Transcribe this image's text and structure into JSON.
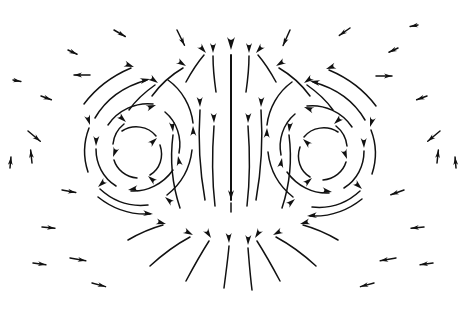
{
  "figure": {
    "caption": "",
    "background_color": "#ffffff",
    "width": 467,
    "height": 319
  },
  "chart_data": {
    "type": "scatter",
    "subtype": "vector-field-quiver",
    "subtitle": "",
    "xlabel": "",
    "ylabel": "",
    "xlim": [
      0,
      467
    ],
    "ylim": [
      0,
      319
    ],
    "grid": false,
    "legend": "none",
    "annotations": [],
    "tick_labels": {
      "x": [],
      "y": []
    },
    "style": {
      "arrow_color": "#111111",
      "cloud_fill": "#b9b9b9",
      "cloud_stipple": "#9a9a9a",
      "background": "#ffffff"
    },
    "features": {
      "cloud_boundary": {
        "description": "stippled gray kidney/mushroom shaped cloud outline band",
        "band_thickness_px": 13,
        "outer_path": "M 66,168 C 64,140 78,110 104,88 C 132,64 168,48 205,43 C 245,38 288,46 320,62 C 352,78 378,100 392,124 C 404,145 406,168 398,186 C 390,204 372,216 350,222 C 320,230 286,228 258,219 C 243,214 234,208 228,202 C 221,209 210,216 196,221 C 170,231 136,233 110,224 C 86,216 70,196 66,168 Z",
        "inner_path": "M 80,168 C 78,144 91,117 114,98 C 140,77 172,62 206,57 C 244,52 283,59 312,74 C 341,89 365,109 378,130 C 388,148 390,167 383,182 C 376,197 360,206 341,211 C 314,218 284,216 259,208 C 244,203 234,195 228,188 C 220,196 209,204 195,209 C 172,218 141,219 118,211 C 97,204 84,188 80,168 Z"
      },
      "vortex_cores": [
        {
          "name": "left-vortex",
          "center_x": 140,
          "center_y": 150,
          "rotation": "clockwise"
        },
        {
          "name": "right-vortex",
          "center_x": 320,
          "center_y": 152,
          "rotation": "counterclockwise"
        }
      ],
      "central_jet": {
        "name": "central-updraft",
        "x": 231,
        "from_y": 200,
        "to_y": 48,
        "direction": "up",
        "description": "strong vertical upward jet arrow through the middle"
      }
    },
    "streamlines": [
      {
        "id": "L-core-1",
        "path": "M 122,131 C 133,124 148,126 156,136",
        "head": [
          157,
          138,
          42
        ]
      },
      {
        "id": "L-core-2",
        "path": "M 160,145 C 164,157 160,169 150,175",
        "head": [
          148,
          176,
          140
        ]
      },
      {
        "id": "L-core-3",
        "path": "M 137,178 C 126,177 117,170 114,160",
        "head": [
          113,
          157,
          250
        ]
      },
      {
        "id": "L-core-4",
        "path": "M 113,144 C 114,134 119,128 124,124",
        "head": [
          126,
          122,
          318
        ]
      },
      {
        "id": "L-mid-1",
        "path": "M 108,125 C 118,110 136,102 153,104",
        "head": [
          156,
          105,
          20
        ]
      },
      {
        "id": "L-mid-2",
        "path": "M 165,112 C 177,122 182,138 179,153",
        "head": [
          178,
          156,
          100
        ]
      },
      {
        "id": "L-mid-3",
        "path": "M 173,170 C 163,184 147,192 131,191",
        "head": [
          128,
          190,
          190
        ]
      },
      {
        "id": "L-mid-4",
        "path": "M 116,186 C 103,178 96,164 96,149",
        "head": [
          96,
          146,
          268
        ]
      },
      {
        "id": "L-outer-1",
        "path": "M 95,118 C 106,99 125,86 147,80",
        "head": [
          150,
          79,
          12
        ]
      },
      {
        "id": "L-outer-2",
        "path": "M 168,80 C 182,90 191,106 193,123",
        "head": [
          193,
          126,
          92
        ]
      },
      {
        "id": "L-outer-3",
        "path": "M 192,150 C 190,168 181,184 167,195",
        "head": [
          165,
          197,
          140
        ]
      },
      {
        "id": "L-outer-4",
        "path": "M 148,205 C 130,207 113,201 100,189",
        "head": [
          98,
          187,
          222
        ]
      },
      {
        "id": "L-outer-5",
        "path": "M 88,172 C 83,157 84,141 89,128",
        "head": [
          90,
          125,
          287
        ]
      },
      {
        "id": "L-rim-1",
        "path": "M 98,197 C 113,209 131,215 150,214",
        "head": [
          153,
          214,
          355
        ]
      },
      {
        "id": "L-rim-2",
        "path": "M 84,104 C 96,88 112,76 131,68",
        "head": [
          134,
          67,
          340
        ]
      },
      {
        "id": "L-up-1",
        "path": "M 205,200 C 200,172 198,140 200,110",
        "head": [
          200,
          107,
          272
        ]
      },
      {
        "id": "L-up-2",
        "path": "M 180,208 C 172,184 170,158 173,135",
        "head": [
          173,
          132,
          276
        ]
      },
      {
        "id": "L-up-3",
        "path": "M 215,206 C 212,180 212,152 214,126",
        "head": [
          214,
          123,
          272
        ]
      },
      {
        "id": "C-jet",
        "path": "M 231,200 L 231,55",
        "head": [
          231,
          50,
          270
        ]
      },
      {
        "id": "C-left-up",
        "path": "M 216,92 C 214,78 213,66 213,56",
        "head": [
          213,
          53,
          270
        ]
      },
      {
        "id": "C-right-up",
        "path": "M 246,92 C 248,78 249,66 249,56",
        "head": [
          249,
          53,
          270
        ]
      },
      {
        "id": "R-up-1",
        "path": "M 256,200 C 261,172 263,140 261,110",
        "head": [
          261,
          107,
          268
        ]
      },
      {
        "id": "R-up-2",
        "path": "M 282,208 C 290,184 292,158 289,135",
        "head": [
          289,
          132,
          264
        ]
      },
      {
        "id": "R-up-3",
        "path": "M 247,206 C 250,180 250,152 248,126",
        "head": [
          248,
          123,
          268
        ]
      },
      {
        "id": "R-core-1",
        "path": "M 338,132 C 327,125 312,127 304,137",
        "head": [
          303,
          139,
          138
        ]
      },
      {
        "id": "R-core-2",
        "path": "M 300,147 C 296,159 300,171 310,177",
        "head": [
          312,
          178,
          40
        ]
      },
      {
        "id": "R-core-3",
        "path": "M 323,180 C 334,179 343,172 346,162",
        "head": [
          347,
          159,
          290
        ]
      },
      {
        "id": "R-core-4",
        "path": "M 347,146 C 346,136 341,130 336,126",
        "head": [
          334,
          124,
          222
        ]
      },
      {
        "id": "R-mid-1",
        "path": "M 352,127 C 342,112 324,104 307,106",
        "head": [
          304,
          107,
          160
        ]
      },
      {
        "id": "R-mid-2",
        "path": "M 295,114 C 283,124 278,140 281,155",
        "head": [
          282,
          158,
          80
        ]
      },
      {
        "id": "R-mid-3",
        "path": "M 287,172 C 297,186 313,194 329,193",
        "head": [
          332,
          192,
          350
        ]
      },
      {
        "id": "R-mid-4",
        "path": "M 344,188 C 357,180 364,166 364,151",
        "head": [
          364,
          148,
          272
        ]
      },
      {
        "id": "R-outer-1",
        "path": "M 365,120 C 354,101 335,88 313,82",
        "head": [
          310,
          81,
          168
        ]
      },
      {
        "id": "R-outer-2",
        "path": "M 292,82 C 278,92 269,108 267,125",
        "head": [
          267,
          128,
          88
        ]
      },
      {
        "id": "R-outer-3",
        "path": "M 268,152 C 270,170 279,186 293,197",
        "head": [
          295,
          199,
          40
        ]
      },
      {
        "id": "R-outer-4",
        "path": "M 312,207 C 330,209 347,203 360,191",
        "head": [
          362,
          189,
          318
        ]
      },
      {
        "id": "R-outer-5",
        "path": "M 372,174 C 377,159 376,143 371,130",
        "head": [
          370,
          127,
          253
        ]
      },
      {
        "id": "R-rim-1",
        "path": "M 362,199 C 347,211 329,217 310,216",
        "head": [
          307,
          216,
          185
        ]
      },
      {
        "id": "R-rim-2",
        "path": "M 376,106 C 364,90 348,78 329,70",
        "head": [
          326,
          69,
          200
        ]
      },
      {
        "id": "cap-L-1",
        "path": "M 152,96 C 160,85 171,75 183,68",
        "head": [
          186,
          66,
          328
        ]
      },
      {
        "id": "cap-L-2",
        "path": "M 186,82 C 192,71 198,62 204,55",
        "head": [
          206,
          53,
          312
        ]
      },
      {
        "id": "cap-L-3",
        "path": "M 129,110 C 136,100 145,92 155,85",
        "head": [
          158,
          83,
          325
        ]
      },
      {
        "id": "cap-R-1",
        "path": "M 310,96 C 302,85 291,75 279,68",
        "head": [
          276,
          66,
          212
        ]
      },
      {
        "id": "cap-R-2",
        "path": "M 276,82 C 270,71 264,62 258,55",
        "head": [
          256,
          53,
          228
        ]
      },
      {
        "id": "cap-R-3",
        "path": "M 333,110 C 326,100 317,92 307,85",
        "head": [
          304,
          83,
          215
        ]
      },
      {
        "id": "bot-in-L1",
        "path": "M 150,266 C 163,254 177,244 190,237",
        "head": [
          193,
          235,
          332
        ]
      },
      {
        "id": "bot-in-L2",
        "path": "M 186,281 C 194,266 202,252 209,241",
        "head": [
          211,
          238,
          303
        ]
      },
      {
        "id": "bot-in-L3",
        "path": "M 224,288 C 226,272 228,258 229,246",
        "head": [
          229,
          243,
          272
        ]
      },
      {
        "id": "bot-in-R1",
        "path": "M 316,266 C 303,254 289,244 276,237",
        "head": [
          273,
          235,
          208
        ]
      },
      {
        "id": "bot-in-R2",
        "path": "M 280,281 C 272,266 264,252 257,241",
        "head": [
          255,
          238,
          237
        ]
      },
      {
        "id": "bot-in-R3",
        "path": "M 252,290 C 250,274 249,260 248,248",
        "head": [
          248,
          245,
          268
        ]
      },
      {
        "id": "bot-out-L",
        "path": "M 128,240 C 140,233 152,228 163,225",
        "head": [
          166,
          224,
          345
        ]
      },
      {
        "id": "bot-out-R",
        "path": "M 338,240 C 326,233 314,228 303,225",
        "head": [
          300,
          224,
          195
        ]
      },
      {
        "id": "notch-tick",
        "path": "M 231,212 L 231,203",
        "head": [
          231,
          200,
          270
        ]
      }
    ],
    "field_arrows": [
      {
        "id": "ff-1",
        "x": 28,
        "y": 131,
        "angle": 320,
        "len": 16
      },
      {
        "id": "ff-2",
        "x": 32,
        "y": 163,
        "angle": 96,
        "len": 13
      },
      {
        "id": "ff-3",
        "x": 41,
        "y": 96,
        "angle": 340,
        "len": 11
      },
      {
        "id": "ff-4",
        "x": 68,
        "y": 50,
        "angle": 335,
        "len": 10
      },
      {
        "id": "ff-5",
        "x": 90,
        "y": 75,
        "angle": 180,
        "len": 16
      },
      {
        "id": "ff-6",
        "x": 42,
        "y": 227,
        "angle": 355,
        "len": 13
      },
      {
        "id": "ff-7",
        "x": 70,
        "y": 258,
        "angle": 350,
        "len": 16
      },
      {
        "id": "ff-8",
        "x": 92,
        "y": 283,
        "angle": 345,
        "len": 14
      },
      {
        "id": "ff-9",
        "x": 10,
        "y": 168,
        "angle": 85,
        "len": 11
      },
      {
        "id": "ff-10",
        "x": 114,
        "y": 30,
        "angle": 330,
        "len": 13
      },
      {
        "id": "ff-11",
        "x": 177,
        "y": 30,
        "angle": 296,
        "len": 17
      },
      {
        "id": "ff-12",
        "x": 290,
        "y": 30,
        "angle": 246,
        "len": 17
      },
      {
        "id": "ff-13",
        "x": 350,
        "y": 28,
        "angle": 215,
        "len": 13
      },
      {
        "id": "ff-14",
        "x": 398,
        "y": 48,
        "angle": 205,
        "len": 10
      },
      {
        "id": "ff-15",
        "x": 376,
        "y": 76,
        "angle": 0,
        "len": 16
      },
      {
        "id": "ff-16",
        "x": 427,
        "y": 96,
        "angle": 200,
        "len": 11
      },
      {
        "id": "ff-17",
        "x": 440,
        "y": 131,
        "angle": 220,
        "len": 16
      },
      {
        "id": "ff-18",
        "x": 437,
        "y": 163,
        "angle": 84,
        "len": 13
      },
      {
        "id": "ff-19",
        "x": 456,
        "y": 168,
        "angle": 95,
        "len": 11
      },
      {
        "id": "ff-20",
        "x": 424,
        "y": 227,
        "angle": 185,
        "len": 13
      },
      {
        "id": "ff-21",
        "x": 396,
        "y": 258,
        "angle": 190,
        "len": 16
      },
      {
        "id": "ff-22",
        "x": 374,
        "y": 283,
        "angle": 195,
        "len": 14
      },
      {
        "id": "ff-23",
        "x": 404,
        "y": 190,
        "angle": 200,
        "len": 14
      },
      {
        "id": "ff-24",
        "x": 62,
        "y": 190,
        "angle": 350,
        "len": 14
      },
      {
        "id": "ff-25",
        "x": 33,
        "y": 263,
        "angle": 352,
        "len": 13
      },
      {
        "id": "ff-26",
        "x": 433,
        "y": 263,
        "angle": 188,
        "len": 13
      },
      {
        "id": "ff-27",
        "x": 418,
        "y": 25,
        "angle": 190,
        "len": 8
      },
      {
        "id": "ff-28",
        "x": 13,
        "y": 80,
        "angle": 350,
        "len": 8
      }
    ]
  }
}
